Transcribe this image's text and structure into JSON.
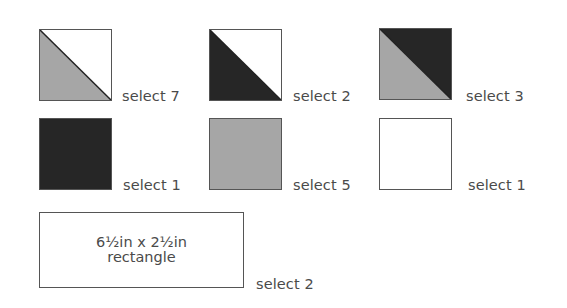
{
  "colors": {
    "dark": "#262626",
    "gray": "#a6a6a6",
    "light": "#ffffff",
    "border": "#555555",
    "text": "#4a4a4a"
  },
  "blocks": [
    {
      "id": "hst-gray-white",
      "type": "half-square-triangle",
      "lower_left": "gray",
      "upper_right": "white",
      "label": "select 7"
    },
    {
      "id": "hst-dark-white",
      "type": "half-square-triangle",
      "lower_left": "dark",
      "upper_right": "white",
      "label": "select 2"
    },
    {
      "id": "hst-gray-dark",
      "type": "half-square-triangle",
      "lower_left": "gray",
      "upper_right": "dark",
      "label": "select 3"
    },
    {
      "id": "solid-dark",
      "type": "solid-square",
      "fill": "dark",
      "label": "select 1"
    },
    {
      "id": "solid-gray",
      "type": "solid-square",
      "fill": "gray",
      "label": "select 5"
    },
    {
      "id": "solid-white",
      "type": "solid-square",
      "fill": "white",
      "label": "select 1"
    }
  ],
  "rectangle": {
    "line1": "6½in x 2½in",
    "line2": "rectangle",
    "label": "select 2"
  }
}
